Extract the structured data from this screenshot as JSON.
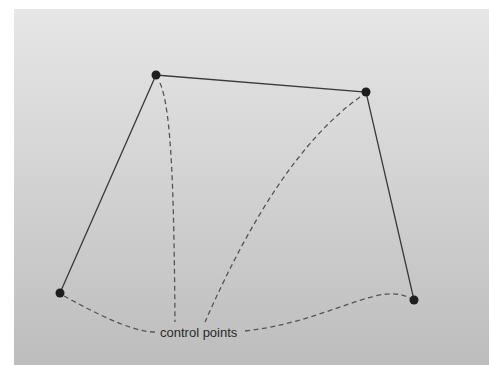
{
  "diagram": {
    "label": "control points",
    "colors": {
      "polygon_stroke": "#3a3a3a",
      "leader_stroke": "#555555",
      "point_fill": "#1e1e1e",
      "label_fill": "#2a2a2a",
      "background_top": "#e6e6e6",
      "background_bottom": "#bdbdbd"
    },
    "control_points": [
      {
        "id": "p1",
        "x": 60,
        "y": 293
      },
      {
        "id": "p2",
        "x": 156,
        "y": 75
      },
      {
        "id": "p3",
        "x": 366,
        "y": 92
      },
      {
        "id": "p4",
        "x": 414,
        "y": 300
      }
    ],
    "label_position": {
      "x": 160,
      "y": 337
    }
  }
}
